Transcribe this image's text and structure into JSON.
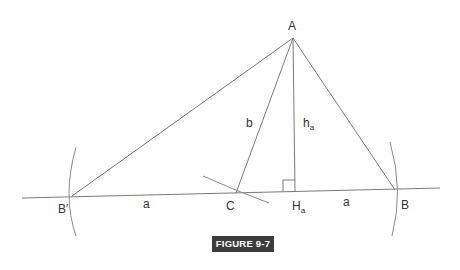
{
  "figure": {
    "caption": "FIGURE 9-7",
    "caption_bg": "#3c3c3c",
    "caption_fg": "#ffffff",
    "line_color": "#7a7a7a"
  },
  "points": {
    "A": {
      "label": "A",
      "x": 293,
      "y": 38
    },
    "B_prime": {
      "label": "B′",
      "x": 72,
      "y": 196
    },
    "C": {
      "label": "C",
      "x": 236,
      "y": 193
    },
    "H_a": {
      "label": "H",
      "sub": "a",
      "x": 295,
      "y": 191
    },
    "B": {
      "label": "B",
      "x": 395,
      "y": 190
    }
  },
  "segment_labels": {
    "b": "b",
    "h_a": {
      "main": "h",
      "sub": "a"
    },
    "a_left": "a",
    "a_right": "a"
  },
  "base_line": {
    "x1": 22,
    "y1": 198,
    "x2": 440,
    "y2": 188
  }
}
